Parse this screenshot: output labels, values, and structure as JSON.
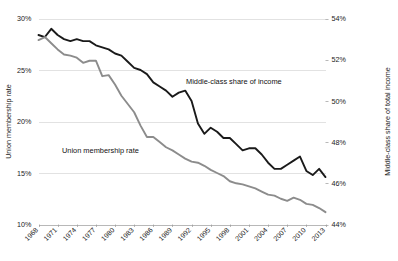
{
  "chart_data": {
    "type": "line",
    "title": "",
    "subtitle": "",
    "xlabel": "",
    "ylabel": "Union membership rate",
    "y2label": "Middle-class share of total income",
    "grid": true,
    "legend_position": "inline-annotations",
    "x": [
      1968,
      1969,
      1970,
      1971,
      1972,
      1973,
      1974,
      1975,
      1976,
      1977,
      1978,
      1979,
      1980,
      1981,
      1982,
      1983,
      1984,
      1985,
      1986,
      1987,
      1988,
      1989,
      1990,
      1991,
      1992,
      1993,
      1994,
      1995,
      1996,
      1997,
      1998,
      1999,
      2000,
      2001,
      2002,
      2003,
      2004,
      2005,
      2006,
      2007,
      2008,
      2009,
      2010,
      2011,
      2012,
      2013
    ],
    "xtick_labels": [
      "1968",
      "1971",
      "1974",
      "1977",
      "1980",
      "1983",
      "1986",
      "1989",
      "1992",
      "1995",
      "1998",
      "2001",
      "2004",
      "2007",
      "2010",
      "2013"
    ],
    "xtick_values": [
      1968,
      1971,
      1974,
      1977,
      1980,
      1983,
      1986,
      1989,
      1992,
      1995,
      1998,
      2001,
      2004,
      2007,
      2010,
      2013
    ],
    "ylim": [
      10,
      30
    ],
    "ytick_labels": [
      "30%",
      "25%",
      "20%",
      "15%",
      "10%"
    ],
    "ytick_values": [
      30,
      25,
      20,
      15,
      10
    ],
    "y2lim": [
      44,
      54
    ],
    "y2tick_labels": [
      "54%",
      "52%",
      "50%",
      "48%",
      "46%",
      "44%"
    ],
    "y2tick_values": [
      54,
      52,
      50,
      48,
      46,
      44
    ],
    "series": [
      {
        "name": "Middle-class share of income",
        "axis": "right",
        "color": "#1a1a1a",
        "annotation": "Middle-class share of income",
        "values": [
          53.2,
          53.1,
          53.5,
          53.2,
          53.0,
          52.9,
          53.0,
          52.9,
          52.9,
          52.7,
          52.6,
          52.5,
          52.3,
          52.2,
          51.9,
          51.6,
          51.5,
          51.3,
          50.9,
          50.7,
          50.5,
          50.2,
          50.4,
          50.5,
          50.0,
          48.9,
          48.4,
          48.7,
          48.5,
          48.2,
          48.2,
          47.9,
          47.6,
          47.7,
          47.7,
          47.4,
          47.0,
          46.7,
          46.7,
          46.9,
          47.1,
          47.3,
          46.6,
          46.4,
          46.7,
          46.3
        ]
      },
      {
        "name": "Union membership rate",
        "axis": "left",
        "color": "#8c8c8c",
        "annotation": "Union membership rate",
        "values": [
          27.9,
          28.2,
          27.6,
          27.0,
          26.5,
          26.4,
          26.2,
          25.7,
          25.9,
          25.9,
          24.4,
          24.5,
          23.6,
          22.5,
          21.7,
          20.9,
          19.6,
          18.5,
          18.5,
          18.0,
          17.5,
          17.2,
          16.8,
          16.4,
          16.1,
          16.0,
          15.7,
          15.3,
          15.0,
          14.7,
          14.2,
          14.0,
          13.9,
          13.7,
          13.5,
          13.2,
          12.9,
          12.8,
          12.5,
          12.3,
          12.6,
          12.4,
          12.0,
          11.9,
          11.6,
          11.2
        ]
      }
    ]
  }
}
